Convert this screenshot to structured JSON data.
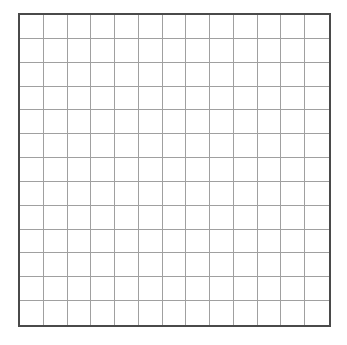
{
  "grid": {
    "rows": 13,
    "columns": 13,
    "border_color": "#4a4a4a",
    "line_color": "#a0a0a0",
    "background": "#ffffff"
  }
}
